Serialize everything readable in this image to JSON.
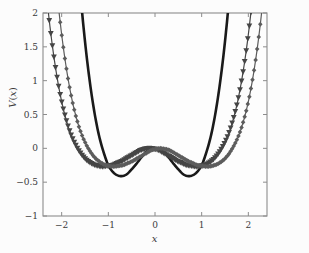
{
  "chart_data": {
    "type": "line",
    "title": "",
    "xlabel": "x",
    "ylabel": "V(x)",
    "xlim": [
      -2.4,
      2.4
    ],
    "ylim": [
      -1,
      2
    ],
    "xticks": [
      -2,
      -1,
      0,
      1,
      2
    ],
    "xtick_labels": [
      "−2",
      "−1",
      "0",
      "1",
      "2"
    ],
    "yticks": [
      -1,
      -0.5,
      0,
      0.5,
      1,
      1.5,
      2
    ],
    "ytick_labels": [
      "−1",
      "−0.5",
      "0",
      "0.5",
      "1",
      "1.5",
      "2"
    ],
    "grid": false,
    "legend": "none",
    "background": "#fcfcfc",
    "axis_color": "#8c8c8c",
    "series": [
      {
        "name": "solid-black-curve",
        "marker": "none",
        "linestyle": "solid",
        "color": "#1a1a1a",
        "linewidth": 2.6,
        "minimum_y": -0.25,
        "minimum_x": [
          -1.0,
          1.0
        ],
        "center_y": 0.0,
        "x": [
          -2.4,
          -2.3,
          -2.2,
          -2.1,
          -2.0,
          -1.9,
          -1.8,
          -1.7,
          -1.6,
          -1.5,
          -1.4,
          -1.3,
          -1.2,
          -1.1,
          -1.0,
          -0.9,
          -0.8,
          -0.7,
          -0.6,
          -0.5,
          -0.4,
          -0.3,
          -0.2,
          -0.1,
          0.0,
          0.1,
          0.2,
          0.3,
          0.4,
          0.5,
          0.6,
          0.7,
          0.8,
          0.9,
          1.0,
          1.1,
          1.2,
          1.3,
          1.4,
          1.5,
          1.6,
          1.7,
          1.8,
          1.9,
          2.0,
          2.1,
          2.2,
          2.3,
          2.4
        ],
        "y": [
          15.75,
          13.09,
          10.76,
          8.75,
          7.0,
          5.5,
          4.24,
          3.18,
          2.3,
          1.58,
          1.0,
          0.54,
          0.19,
          -0.06,
          -0.25,
          -0.35,
          -0.4,
          -0.41,
          -0.38,
          -0.31,
          -0.23,
          -0.14,
          -0.06,
          -0.02,
          0.0,
          -0.02,
          -0.06,
          -0.14,
          -0.23,
          -0.31,
          -0.38,
          -0.41,
          -0.4,
          -0.35,
          -0.25,
          -0.06,
          0.19,
          0.54,
          1.0,
          1.58,
          2.3,
          3.18,
          4.24,
          5.5,
          7.0,
          8.75,
          10.76,
          13.09,
          15.75
        ]
      },
      {
        "name": "triangle-marker-curve",
        "marker": "triangle-down",
        "linestyle": "solid",
        "color": "#454545",
        "linewidth": 1.2,
        "minimum_y": -0.57,
        "minimum_x": [
          -1.3,
          1.3
        ],
        "center_y": 0.0,
        "x": [
          -2.4,
          -2.3,
          -2.2,
          -2.1,
          -2.0,
          -1.9,
          -1.8,
          -1.7,
          -1.6,
          -1.5,
          -1.4,
          -1.3,
          -1.2,
          -1.1,
          -1.0,
          -0.9,
          -0.8,
          -0.7,
          -0.6,
          -0.5,
          -0.4,
          -0.3,
          -0.2,
          -0.1,
          0.0,
          0.1,
          0.2,
          0.3,
          0.4,
          0.5,
          0.6,
          0.7,
          0.8,
          0.9,
          1.0,
          1.1,
          1.2,
          1.3,
          1.4,
          1.5,
          1.6,
          1.7,
          1.8,
          1.9,
          2.0,
          2.1,
          2.2,
          2.3,
          2.4
        ],
        "y": [
          3.8,
          2.93,
          2.2,
          1.6,
          1.12,
          0.74,
          0.45,
          0.23,
          0.07,
          -0.05,
          -0.14,
          -0.2,
          -0.24,
          -0.26,
          -0.27,
          -0.26,
          -0.25,
          -0.22,
          -0.19,
          -0.15,
          -0.11,
          -0.07,
          -0.03,
          -0.01,
          0.0,
          -0.01,
          -0.03,
          -0.07,
          -0.11,
          -0.15,
          -0.19,
          -0.22,
          -0.25,
          -0.26,
          -0.27,
          -0.26,
          -0.24,
          -0.2,
          -0.14,
          -0.05,
          0.07,
          0.23,
          0.45,
          0.74,
          1.12,
          1.6,
          2.2,
          2.93,
          3.8
        ]
      },
      {
        "name": "diamond-marker-curve",
        "marker": "diamond",
        "linestyle": "solid",
        "color": "#5c5c5c",
        "linewidth": 1.2,
        "minimum_y": -0.57,
        "minimum_x": [
          -1.3,
          1.3
        ],
        "center_y": 0.0,
        "x": [
          -2.4,
          -2.3,
          -2.2,
          -2.1,
          -2.0,
          -1.9,
          -1.8,
          -1.7,
          -1.6,
          -1.5,
          -1.4,
          -1.3,
          -1.2,
          -1.1,
          -1.0,
          -0.9,
          -0.8,
          -0.7,
          -0.6,
          -0.5,
          -0.4,
          -0.3,
          -0.2,
          -0.1,
          0.0,
          0.1,
          0.2,
          0.3,
          0.4,
          0.5,
          0.6,
          0.7,
          0.8,
          0.9,
          1.0,
          1.1,
          1.2,
          1.3,
          1.4,
          1.5,
          1.6,
          1.7,
          1.8,
          1.9,
          2.0,
          2.1,
          2.2,
          2.3,
          2.4
        ],
        "y": [
          3.8,
          2.93,
          2.2,
          1.6,
          1.12,
          0.74,
          0.45,
          0.23,
          0.07,
          -0.05,
          -0.14,
          -0.2,
          -0.24,
          -0.26,
          -0.27,
          -0.26,
          -0.25,
          -0.22,
          -0.19,
          -0.15,
          -0.11,
          -0.07,
          -0.03,
          -0.01,
          0.0,
          -0.01,
          -0.03,
          -0.07,
          -0.11,
          -0.15,
          -0.19,
          -0.22,
          -0.25,
          -0.26,
          -0.27,
          -0.26,
          -0.24,
          -0.2,
          -0.14,
          -0.05,
          0.07,
          0.23,
          0.45,
          0.74,
          1.12,
          1.6,
          2.2,
          2.93,
          3.8
        ]
      }
    ]
  }
}
